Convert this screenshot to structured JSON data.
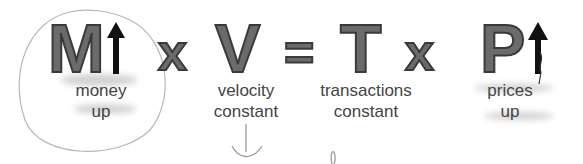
{
  "equation": {
    "terms": [
      {
        "symbol": "M",
        "label_line1": "money",
        "label_line2": "up",
        "arrow": "up"
      },
      {
        "symbol": "V",
        "label_line1": "velocity",
        "label_line2": "constant"
      },
      {
        "symbol": "T",
        "label_line1": "transactions",
        "label_line2": "constant"
      },
      {
        "symbol": "P",
        "label_line1": "prices",
        "label_line2": "up",
        "arrow": "up"
      }
    ],
    "operators": [
      "x",
      "=",
      "x"
    ]
  },
  "colors": {
    "letter_fill": "#6b6b6b",
    "letter_stroke": "#3a3a3a",
    "arrow": "#111111",
    "label_text": "#444444",
    "pencil": "#9a9a9a"
  }
}
